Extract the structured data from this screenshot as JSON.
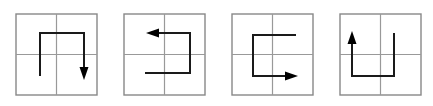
{
  "figure": {
    "type": "visual-reasoning-sequence",
    "background_color": "#ffffff",
    "panel_count": 4,
    "panel_width": 108,
    "panel_height": 106,
    "square": {
      "x": 16,
      "y": 14,
      "size": 81,
      "border_color": "#888888",
      "border_width": 1.4,
      "grid_color": "#999999",
      "grid_width": 1.2,
      "grid_divisions": 2
    },
    "path_style": {
      "stroke_color": "#1a1a1a",
      "stroke_width": 2.0,
      "arrow_fill": "#000000",
      "arrow_length": 13,
      "arrow_half_width": 4.5
    },
    "panels": [
      {
        "index": 1,
        "name": "panel-1",
        "label": "",
        "shape": "staple-down",
        "description": "Path starts at lower-left stub, rises upward, turns right along the top, then descends ending with a downward arrowhead.",
        "arrow_direction": "down",
        "offset_x": 0,
        "points": [
          [
            40,
            76
          ],
          [
            40,
            33
          ],
          [
            84,
            33
          ],
          [
            84,
            80
          ]
        ]
      },
      {
        "index": 2,
        "name": "panel-2",
        "label": "",
        "shape": "s-shape-left",
        "description": "Path starts at the lower-left stub, travels right, rises upward, then turns left ending with a leftward arrowhead.",
        "arrow_direction": "left",
        "offset_x": 108,
        "points": [
          [
            145,
            73
          ],
          [
            190,
            73
          ],
          [
            190,
            33
          ],
          [
            146,
            33
          ]
        ]
      },
      {
        "index": 3,
        "name": "panel-3",
        "label": "",
        "shape": "c-shape-right",
        "description": "Path starts at the upper-right stub, travels left, descends, then turns right ending with a rightward arrowhead.",
        "arrow_direction": "right",
        "offset_x": 216,
        "points": [
          [
            296,
            35
          ],
          [
            253,
            35
          ],
          [
            253,
            76
          ],
          [
            298,
            76
          ]
        ]
      },
      {
        "index": 4,
        "name": "panel-4",
        "label": "",
        "shape": "u-shape-up",
        "description": "Path starts at the upper-right stub, descends, travels left along the bottom, then rises ending with an upward arrowhead.",
        "arrow_direction": "up",
        "offset_x": 324,
        "points": [
          [
            394,
            33
          ],
          [
            394,
            76
          ],
          [
            352,
            76
          ],
          [
            352,
            31
          ]
        ]
      }
    ]
  }
}
